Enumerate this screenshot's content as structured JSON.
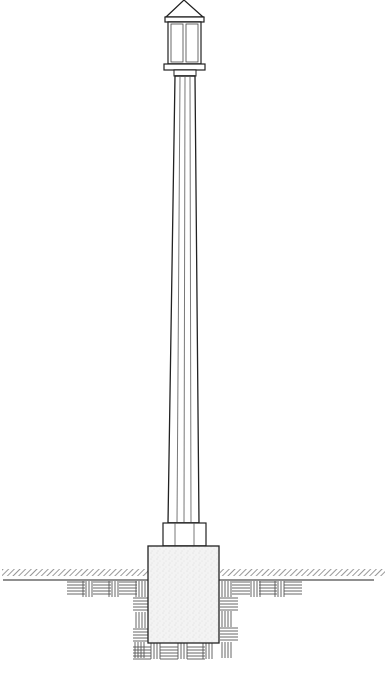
{
  "diagram": {
    "stroke_color": "#222222",
    "fill_concrete": "#f2f2f2",
    "hatch_color": "#555555",
    "parts": [
      {
        "id": "lantern-roof",
        "label": "Pyramidal lantern roof"
      },
      {
        "id": "lantern-body",
        "label": "Lantern with two glass panes"
      },
      {
        "id": "lantern-base",
        "label": "Lantern base plate"
      },
      {
        "id": "shaft",
        "label": "Fluted tapered shaft"
      },
      {
        "id": "pedestal",
        "label": "Shaft base collar"
      },
      {
        "id": "footing",
        "label": "Concrete footing"
      },
      {
        "id": "grade",
        "label": "Ground line (hatched)"
      },
      {
        "id": "soil",
        "label": "Compacted soil hatching"
      }
    ]
  }
}
